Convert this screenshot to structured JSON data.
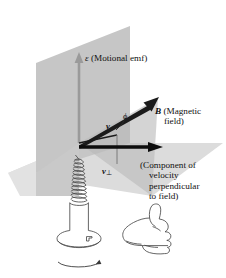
{
  "figure": {
    "type": "physics-vector-diagram"
  },
  "labels": {
    "emf_symbol": "ε",
    "emf_text": "(Motional emf)",
    "b_symbol": "B",
    "b_text_line1": "(Magnetic",
    "b_text_line2": "field)",
    "v_symbol": "v",
    "phi_symbol": "ϕ",
    "vperp_symbol": "v",
    "vperp_sub": "⊥",
    "perp_line1": "(Component of",
    "perp_line2": "velocity",
    "perp_line3": "perpendicular",
    "perp_line4": "to field)"
  },
  "objects": {
    "screw_name": "screw",
    "hand_name": "right-hand-thumbs-up",
    "rotation_name": "rotation-arrow"
  },
  "colors": {
    "vertical_plane": "#c6c6c6",
    "horizontal_plane": "#dcdcdc",
    "angle_wedge": "#b4b4b4",
    "emf_arrow": "#9a9a9a",
    "vector_black": "#101010",
    "outline": "#555555",
    "background": "#ffffff"
  },
  "geometry": {
    "origin": [
      79,
      143
    ],
    "emf_tip": [
      79,
      55
    ],
    "b_tip": [
      158,
      98
    ],
    "vperp_tip": [
      160,
      147
    ],
    "v_tip": [
      120,
      134
    ]
  }
}
